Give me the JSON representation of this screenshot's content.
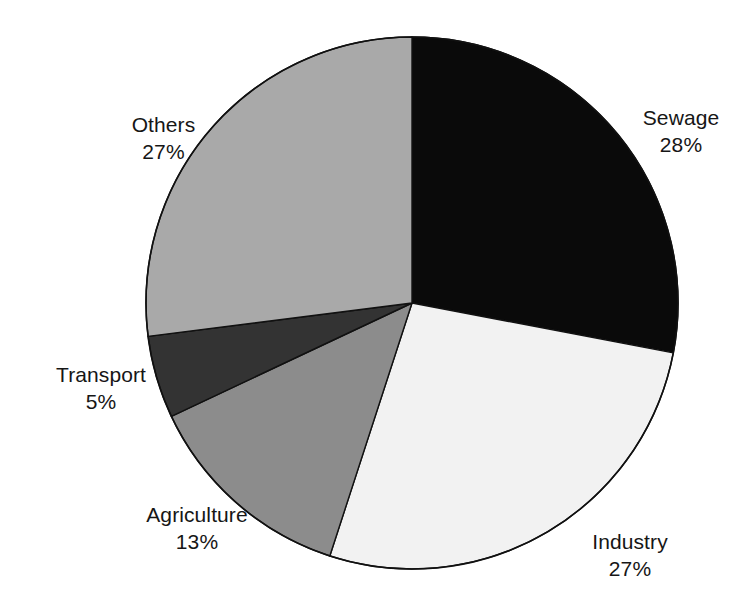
{
  "chart_data": {
    "type": "pie",
    "title": "",
    "categories": [
      "Sewage",
      "Industry",
      "Agriculture",
      "Transport",
      "Others"
    ],
    "values": [
      28,
      27,
      13,
      5,
      27
    ],
    "value_suffix": "%",
    "start_angle_deg": 0,
    "direction": "clockwise",
    "legend_position": "none",
    "labels_outside": true,
    "grid": false,
    "slices": [
      {
        "label": "Sewage",
        "value": 28,
        "value_text": "28%",
        "color": "#0a0a0a",
        "start_deg": 0.0,
        "end_deg": 100.8
      },
      {
        "label": "Industry",
        "value": 27,
        "value_text": "27%",
        "color": "#f2f2f2",
        "start_deg": 100.8,
        "end_deg": 198.0
      },
      {
        "label": "Agriculture",
        "value": 13,
        "value_text": "13%",
        "color": "#8c8c8c",
        "start_deg": 198.0,
        "end_deg": 244.8
      },
      {
        "label": "Transport",
        "value": 5,
        "value_text": "5%",
        "color": "#333333",
        "start_deg": 244.8,
        "end_deg": 262.8
      },
      {
        "label": "Others",
        "value": 27,
        "value_text": "27%",
        "color": "#a9a9a9",
        "start_deg": 262.8,
        "end_deg": 360.0
      }
    ]
  },
  "geometry": {
    "center_x": 412,
    "center_y": 303,
    "radius": 266,
    "outline_color": "#111111"
  },
  "labels": {
    "sewage": {
      "name": "Sewage",
      "value": "28%"
    },
    "industry": {
      "name": "Industry",
      "value": "27%"
    },
    "agriculture": {
      "name": "Agriculture",
      "value": "13%"
    },
    "transport": {
      "name": "Transport",
      "value": "5%"
    },
    "others": {
      "name": "Others",
      "value": "27%"
    }
  }
}
